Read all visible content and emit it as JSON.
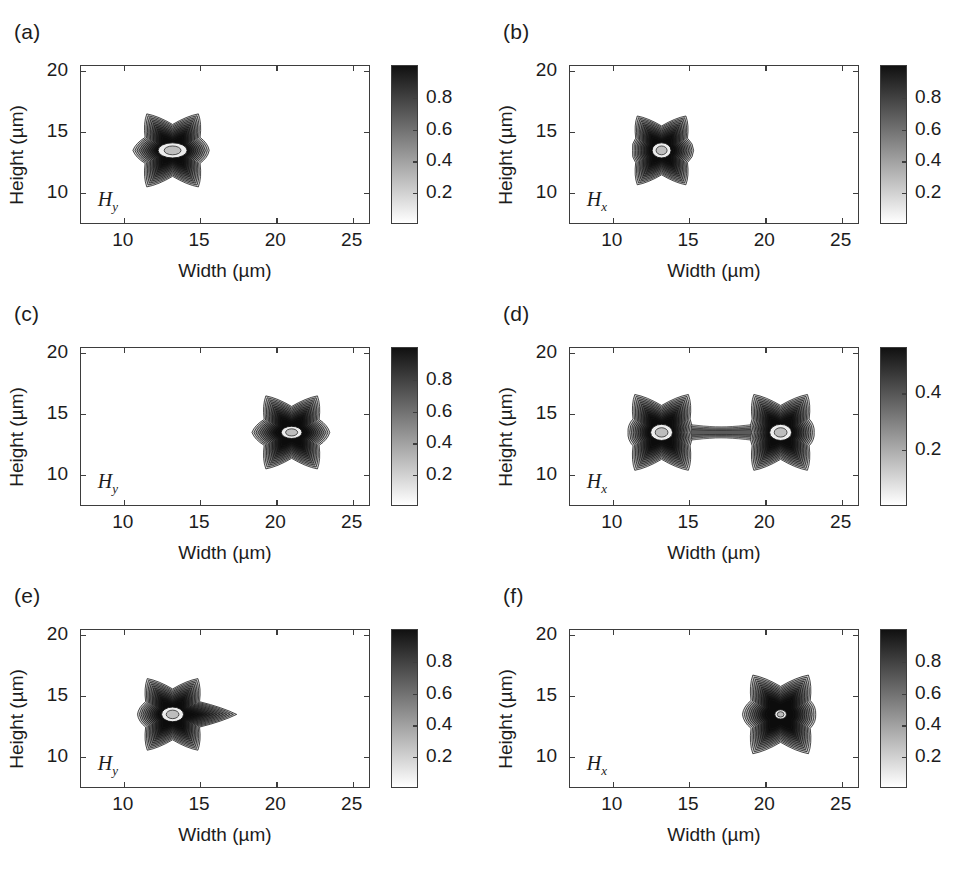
{
  "figure": {
    "width": 978,
    "height": 889,
    "background": "#ffffff",
    "ink": "#1c1c1c",
    "frame_color": "#3d3d3d"
  },
  "axis": {
    "xlabel": "Width (µm)",
    "ylabel": "Height (µm)",
    "xlim": [
      7.2,
      26.2
    ],
    "ylim": [
      7.4,
      20.4
    ],
    "xticks": [
      10,
      15,
      20,
      25
    ],
    "xticklabels": [
      "10",
      "15",
      "20",
      "25"
    ],
    "yticks": [
      10,
      15,
      20
    ],
    "yticklabels": [
      "10",
      "15",
      "20"
    ],
    "grid": false
  },
  "colorbar": {
    "orientation": "vertical",
    "position": "right",
    "low_color": "#ffffff",
    "high_color": "#111111",
    "scale_a": {
      "ticks": [
        0.2,
        0.4,
        0.6,
        0.8
      ],
      "ticklabels": [
        "0.2",
        "0.4",
        "0.6",
        "0.8"
      ],
      "range": [
        0,
        1.0
      ]
    },
    "scale_d": {
      "ticks": [
        0.2,
        0.4
      ],
      "ticklabels": [
        "0.2",
        "0.4"
      ],
      "range": [
        0,
        0.56
      ]
    }
  },
  "panels": [
    {
      "id": "a",
      "label": "(a)",
      "field_label_main": "H",
      "field_label_sub": "y",
      "colorbar_scale": "scale_a",
      "lobes": [
        {
          "cx": 13.2,
          "cy": 13.5,
          "r": 2.6,
          "arm_left": 2.6,
          "arm_right": 2.4,
          "core_rx": 0.95,
          "core_ry": 0.62
        }
      ],
      "description": "Six-pointed star mode centred near 13.2 um with elliptical hollow core"
    },
    {
      "id": "b",
      "label": "(b)",
      "field_label_main": "H",
      "field_label_sub": "x",
      "colorbar_scale": "scale_a",
      "lobes": [
        {
          "cx": 13.2,
          "cy": 13.5,
          "r": 2.45,
          "arm_left": 1.9,
          "arm_right": 2.1,
          "core_rx": 0.62,
          "core_ry": 0.62
        }
      ],
      "description": "Six-pointed star mode centred near 13.2 um with round hollow core"
    },
    {
      "id": "c",
      "label": "(c)",
      "field_label_main": "H",
      "field_label_sub": "y",
      "colorbar_scale": "scale_a",
      "lobes": [
        {
          "cx": 21.0,
          "cy": 13.5,
          "r": 2.6,
          "arm_left": 2.6,
          "arm_right": 2.5,
          "core_rx": 0.68,
          "core_ry": 0.5
        }
      ],
      "description": "Six-pointed star mode shifted to the right core near 21 um"
    },
    {
      "id": "d",
      "label": "(d)",
      "field_label_main": "H",
      "field_label_sub": "x",
      "colorbar_scale": "scale_d",
      "lobes": [
        {
          "cx": 13.2,
          "cy": 13.5,
          "r": 2.7,
          "arm_left": 2.2,
          "arm_right": 1.9,
          "core_rx": 0.72,
          "core_ry": 0.66
        },
        {
          "cx": 21.0,
          "cy": 13.5,
          "r": 2.7,
          "arm_left": 1.9,
          "arm_right": 2.2,
          "core_rx": 0.72,
          "core_ry": 0.66
        }
      ],
      "bridge": true,
      "description": "Two coupled star lobes at 13.2 and 21 um joined by a weak bridge"
    },
    {
      "id": "e",
      "label": "(e)",
      "field_label_main": "H",
      "field_label_sub": "y",
      "colorbar_scale": "scale_a",
      "lobes": [
        {
          "cx": 13.2,
          "cy": 13.5,
          "r": 2.55,
          "arm_left": 2.3,
          "arm_right": 4.2,
          "core_rx": 0.72,
          "core_ry": 0.6
        }
      ],
      "description": "Star mode at 13.2 um with an elongated arm extending right to about 19 um"
    },
    {
      "id": "f",
      "label": "(f)",
      "field_label_main": "H",
      "field_label_sub": "x",
      "colorbar_scale": "scale_a",
      "lobes": [
        {
          "cx": 21.0,
          "cy": 13.5,
          "r": 2.8,
          "arm_left": 2.5,
          "arm_right": 2.3,
          "core_rx": 0.38,
          "core_ry": 0.38
        }
      ],
      "description": "Six-pointed star mode at 21 um with a very small bright core"
    }
  ],
  "chart_data": {
    "type": "heatmap",
    "title": "",
    "subtitle": "",
    "n_panels": 6,
    "panel_layout": "3 rows x 2 columns",
    "xlabel": "Width (µm)",
    "ylabel": "Height (µm)",
    "xlim": [
      7.2,
      26.2
    ],
    "ylim": [
      7.4,
      20.4
    ],
    "xticks": [
      10,
      15,
      20,
      25
    ],
    "yticks": [
      10,
      15,
      20
    ],
    "grid": false,
    "legend_position": "right colorbar per panel",
    "colormap": "gray reversed (white = low, black = high)",
    "panels": [
      {
        "label": "(a)",
        "field": "Hy",
        "cbar_ticks": [
          0.2,
          0.4,
          0.6,
          0.8
        ],
        "cbar_max": 1.0,
        "peak_center_x": 13.2,
        "peak_center_y": 13.5,
        "n_lobes": 1
      },
      {
        "label": "(b)",
        "field": "Hx",
        "cbar_ticks": [
          0.2,
          0.4,
          0.6,
          0.8
        ],
        "cbar_max": 1.0,
        "peak_center_x": 13.2,
        "peak_center_y": 13.5,
        "n_lobes": 1
      },
      {
        "label": "(c)",
        "field": "Hy",
        "cbar_ticks": [
          0.2,
          0.4,
          0.6,
          0.8
        ],
        "cbar_max": 1.0,
        "peak_center_x": 21.0,
        "peak_center_y": 13.5,
        "n_lobes": 1
      },
      {
        "label": "(d)",
        "field": "Hx",
        "cbar_ticks": [
          0.2,
          0.4
        ],
        "cbar_max": 0.56,
        "peak_center_x": 17.1,
        "peak_center_y": 13.5,
        "n_lobes": 2
      },
      {
        "label": "(e)",
        "field": "Hy",
        "cbar_ticks": [
          0.2,
          0.4,
          0.6,
          0.8
        ],
        "cbar_max": 1.0,
        "peak_center_x": 13.2,
        "peak_center_y": 13.5,
        "n_lobes": 1
      },
      {
        "label": "(f)",
        "field": "Hx",
        "cbar_ticks": [
          0.2,
          0.4,
          0.6,
          0.8
        ],
        "cbar_max": 0.88,
        "peak_center_x": 21.0,
        "peak_center_y": 13.5,
        "n_lobes": 1
      }
    ]
  }
}
